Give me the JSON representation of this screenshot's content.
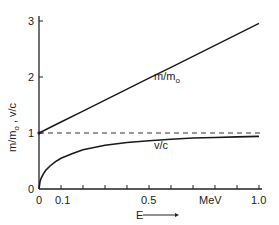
{
  "chart_data": {
    "type": "line",
    "title": "",
    "xlabel": "E",
    "xunit": "MeV",
    "ylabel": "m/m₀ , v/c",
    "xlim": [
      0,
      1.0
    ],
    "ylim": [
      0,
      3
    ],
    "grid": false,
    "legend": "inline annotations",
    "x_ticks": [
      0,
      0.1,
      0.2,
      0.3,
      0.4,
      0.5,
      0.6,
      0.7,
      0.8,
      0.9,
      1.0
    ],
    "x_tick_labels": [
      {
        "value": 0,
        "label": "0"
      },
      {
        "value": 0.1,
        "label": "0.1"
      },
      {
        "value": 0.5,
        "label": "0.5"
      },
      {
        "value": 0.75,
        "label": "MeV"
      },
      {
        "value": 1.0,
        "label": "1.0"
      }
    ],
    "y_ticks": [
      0,
      1,
      2,
      3
    ],
    "y_tick_labels": [
      "0",
      "1",
      "2",
      "3"
    ],
    "series": [
      {
        "name": "m/m₀",
        "style": "solid",
        "x": [
          0,
          0.1,
          0.2,
          0.3,
          0.4,
          0.5,
          0.6,
          0.7,
          0.8,
          0.9,
          1.0
        ],
        "values": [
          1.0,
          1.196,
          1.391,
          1.587,
          1.783,
          1.978,
          2.174,
          2.37,
          2.566,
          2.761,
          2.957
        ]
      },
      {
        "name": "v/c",
        "style": "solid",
        "x": [
          0,
          0.005,
          0.01,
          0.02,
          0.03,
          0.05,
          0.075,
          0.1,
          0.15,
          0.2,
          0.3,
          0.4,
          0.5,
          0.6,
          0.7,
          0.8,
          0.9,
          1.0
        ],
        "values": [
          0,
          0.14,
          0.195,
          0.27,
          0.33,
          0.41,
          0.49,
          0.55,
          0.63,
          0.7,
          0.78,
          0.83,
          0.86,
          0.89,
          0.91,
          0.92,
          0.93,
          0.94
        ]
      },
      {
        "name": "asymptote v/c = 1",
        "style": "dashed",
        "x": [
          0,
          1.0
        ],
        "values": [
          1,
          1
        ]
      }
    ],
    "annotations": [
      {
        "text": "m/m₀",
        "x": 0.62,
        "y": 1.9
      },
      {
        "text": "v/c",
        "x": 0.52,
        "y": 0.75
      },
      {
        "text": "E →",
        "x": 0.45,
        "y": -0.3
      }
    ]
  },
  "labels": {
    "y_axis": "m/m",
    "y_axis_sub": "o",
    "y_axis_rest": " , v/c",
    "x_axis": "E",
    "x_unit": "MeV",
    "mm0": "m/m",
    "mm0_sub": "o",
    "vc": "v/c",
    "tick_x0": "0",
    "tick_x01": "0.1",
    "tick_x05": "0.5",
    "tick_x10": "1.0",
    "tick_y0": "0",
    "tick_y1": "1",
    "tick_y2": "2",
    "tick_y3": "3"
  }
}
